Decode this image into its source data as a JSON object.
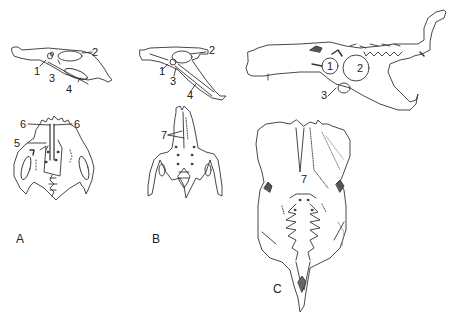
{
  "figure": {
    "panels": [
      {
        "id": "A",
        "label": "A"
      },
      {
        "id": "B",
        "label": "B"
      },
      {
        "id": "C",
        "label": "C"
      }
    ],
    "labels": {
      "A_lateral": [
        "1",
        "2",
        "3",
        "4"
      ],
      "A_ventral": [
        "6",
        "6",
        "5"
      ],
      "B_lateral": [
        "1",
        "2",
        "3",
        "4"
      ],
      "B_ventral": [
        "7"
      ],
      "C_lateral": [
        "1",
        "2",
        "3"
      ],
      "C_ventral": [
        "7"
      ]
    }
  }
}
